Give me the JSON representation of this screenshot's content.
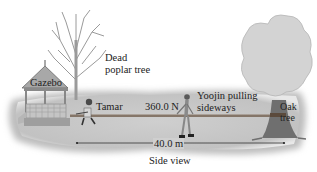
{
  "figure": {
    "caption": "Side view",
    "labels": {
      "gazebo": "Gazebo",
      "dead_tree_line1": "Dead",
      "dead_tree_line2": "poplar tree",
      "tamar": "Tamar",
      "force": "360.0 N",
      "yoojin_line1": "Yoojin pulling",
      "yoojin_line2": "sideways",
      "oak_line1": "Oak",
      "oak_line2": "tree",
      "distance": "40.0 m"
    },
    "colors": {
      "ground": "#c8c8c8",
      "ground_shadow": "#b0b0b0",
      "rope": "#6e5a48",
      "tree_foliage": "#d2d2d2",
      "trunk": "#7a7a7a",
      "dead_tree": "#a8a8a8"
    }
  }
}
